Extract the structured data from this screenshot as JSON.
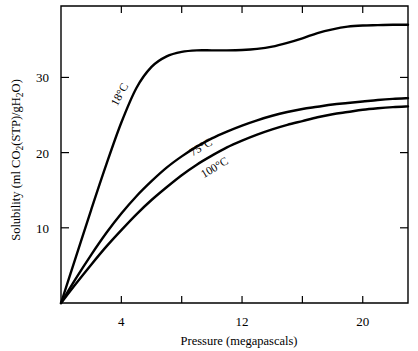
{
  "chart_data": {
    "type": "line",
    "title": "",
    "xlabel": "Pressure (megapascals)",
    "ylabel": "Solubility (ml CO2(STP)/gH2O)",
    "ylabel_parts": {
      "lead": "Solubility (ml CO",
      "sub1": "2",
      "mid": "(STP)/gH",
      "sub2": "2",
      "tail": "O)"
    },
    "xlim": [
      0,
      23
    ],
    "ylim": [
      0,
      39.5
    ],
    "grid": false,
    "legend": "inline-curve-labels",
    "x_ticks": [
      4,
      8,
      12,
      16,
      20
    ],
    "x_tick_labels": [
      "4",
      "",
      "12",
      "",
      "20"
    ],
    "y_ticks": [
      10,
      20,
      30
    ],
    "y_tick_labels": [
      "10",
      "20",
      "30"
    ],
    "series": [
      {
        "name": "18°C",
        "label": "18°C",
        "label_x": 4.1,
        "label_y": 27.5,
        "label_rotation": -62,
        "x": [
          0,
          1,
          2,
          3,
          4,
          5,
          6,
          7,
          8,
          9,
          10,
          11,
          12,
          13,
          14,
          15,
          16,
          17,
          18,
          19,
          20,
          21,
          22,
          23
        ],
        "y": [
          0,
          6.2,
          12.4,
          18.4,
          24.0,
          28.6,
          31.4,
          32.8,
          33.4,
          33.6,
          33.6,
          33.6,
          33.65,
          33.8,
          34.1,
          34.6,
          35.2,
          35.9,
          36.4,
          36.75,
          36.9,
          36.95,
          37.0,
          37.0
        ]
      },
      {
        "name": "75°C",
        "label": "75°C",
        "label_x": 9.4,
        "label_y": 20.3,
        "label_rotation": -31,
        "x": [
          0,
          1,
          2,
          3,
          4,
          5,
          6,
          7,
          8,
          9,
          10,
          11,
          12,
          13,
          14,
          15,
          16,
          17,
          18,
          19,
          20,
          21,
          22,
          23
        ],
        "y": [
          0,
          3.3,
          6.4,
          9.3,
          11.9,
          14.2,
          16.2,
          18.0,
          19.5,
          20.8,
          21.9,
          22.8,
          23.6,
          24.3,
          24.9,
          25.4,
          25.8,
          26.1,
          26.4,
          26.6,
          26.8,
          27.0,
          27.15,
          27.25
        ]
      },
      {
        "name": "100°C",
        "label": "100°C",
        "label_x": 10.3,
        "label_y": 17.6,
        "label_rotation": -31,
        "x": [
          0,
          1,
          2,
          3,
          4,
          5,
          6,
          7,
          8,
          9,
          10,
          11,
          12,
          13,
          14,
          15,
          16,
          17,
          18,
          19,
          20,
          21,
          22,
          23
        ],
        "y": [
          0,
          2.6,
          5.1,
          7.5,
          9.7,
          11.8,
          13.7,
          15.4,
          17.0,
          18.4,
          19.6,
          20.7,
          21.6,
          22.4,
          23.1,
          23.7,
          24.2,
          24.7,
          25.1,
          25.4,
          25.7,
          25.9,
          26.05,
          26.15
        ]
      }
    ],
    "colors": {
      "curve": "#000000",
      "axis": "#000000",
      "background": "#ffffff"
    }
  }
}
